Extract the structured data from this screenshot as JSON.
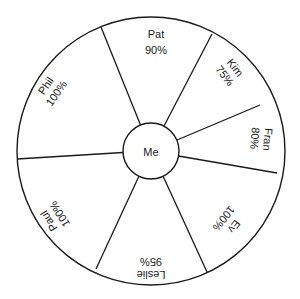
{
  "diagram": {
    "center_label": "Me",
    "colors": {
      "line": "#1a1a1a",
      "background": "#ffffff",
      "text": "#1a1a1a"
    },
    "segments": [
      {
        "name": "Pat",
        "value": "90%"
      },
      {
        "name": "Kim",
        "value": "75%"
      },
      {
        "name": "Fran",
        "value": "80%"
      },
      {
        "name": "Ev",
        "value": "100%"
      },
      {
        "name": "Leslie",
        "value": "95%"
      },
      {
        "name": "Paul",
        "value": "100%"
      },
      {
        "name": "Phil",
        "value": "100%"
      }
    ]
  }
}
